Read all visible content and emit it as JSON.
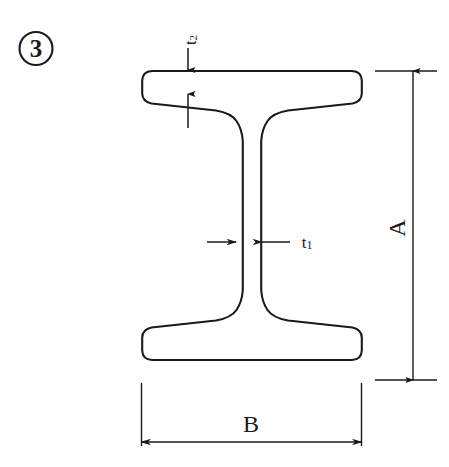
{
  "figure": {
    "index_label": "3",
    "index_badge_shape": "circle",
    "caption": "",
    "background_color": "#ffffff",
    "line_color": "#1a1a1a",
    "profile_type": "I-beam cross section"
  },
  "dimensions": [
    {
      "id": "A",
      "label": "A",
      "meaning": "overall section height",
      "orientation": "vertical",
      "label_rotation_deg": -90,
      "side": "right",
      "line_style": "double-arrow",
      "value": ""
    },
    {
      "id": "B",
      "label": "B",
      "meaning": "overall flange width",
      "orientation": "horizontal",
      "label_rotation_deg": 0,
      "side": "bottom",
      "line_style": "double-arrow",
      "value": ""
    },
    {
      "id": "t1",
      "label": "t",
      "subscript": "1",
      "meaning": "web thickness",
      "orientation": "horizontal",
      "label_rotation_deg": 0,
      "side": "middle-right",
      "line_style": "inward-arrows",
      "value": ""
    },
    {
      "id": "t2",
      "label": "t",
      "subscript": "2",
      "meaning": "flange thickness",
      "orientation": "vertical",
      "label_rotation_deg": -90,
      "side": "top",
      "line_style": "opposed-arrows",
      "value": ""
    }
  ],
  "geometry": {
    "section_top_y": 71,
    "section_bottom_y": 380,
    "flange_left_x": 142,
    "flange_right_x": 361,
    "web_left_x": 237,
    "web_right_x": 261,
    "top_flange_inner_y": 93,
    "bottom_flange_inner_y": 358
  }
}
